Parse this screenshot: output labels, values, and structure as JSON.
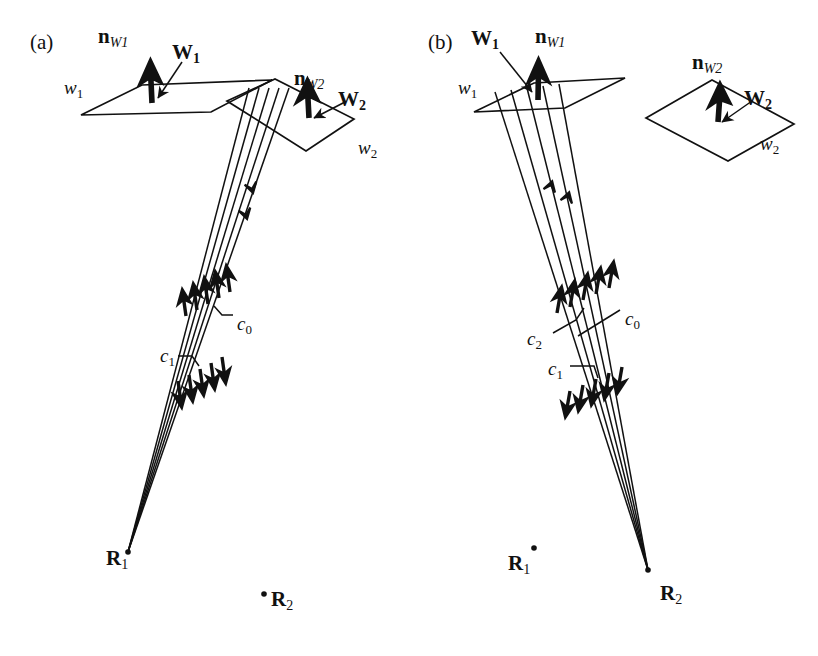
{
  "figure": {
    "background": "#ffffff",
    "ink": "#111111",
    "width": 818,
    "height": 656
  },
  "panels": [
    {
      "id": "a",
      "tag": "(a)",
      "tag_pos": [
        30,
        32
      ],
      "labels": {
        "plane1": "w",
        "plane1_sub": "1",
        "plane1_pos": [
          64,
          78
        ],
        "plane2": "w",
        "plane2_sub": "2",
        "plane2_pos": [
          358,
          138
        ],
        "normal1": "n",
        "normal1_sub": "W1",
        "normal1_pos": [
          98,
          26
        ],
        "normal2": "n",
        "normal2_sub": "W2",
        "normal2_pos": [
          294,
          68
        ],
        "vec1": "W",
        "vec1_sub": "1",
        "vec1_pos": [
          172,
          42
        ],
        "vec2": "W",
        "vec2_sub": "2",
        "vec2_pos": [
          338,
          89
        ],
        "c0": "c",
        "c0_sub": "0",
        "c0_pos": [
          237,
          314
        ],
        "c1": "c",
        "c1_sub": "1",
        "c1_pos": [
          160,
          346
        ],
        "r1": "R",
        "r1_sub": "1",
        "r1_pos": [
          106,
          548
        ],
        "r2": "R",
        "r2_sub": "2",
        "r2_pos": [
          271,
          589
        ]
      },
      "apex": [
        128,
        552
      ],
      "ray_count": 5,
      "ray_direction": "downward",
      "second_point_marker": [
        264,
        594
      ]
    },
    {
      "id": "b",
      "tag": "(b)",
      "tag_pos": [
        428,
        32
      ],
      "labels": {
        "plane1": "w",
        "plane1_sub": "1",
        "plane1_pos": [
          458,
          78
        ],
        "plane2": "w",
        "plane2_sub": "2",
        "plane2_pos": [
          760,
          134
        ],
        "normal1": "n",
        "normal1_sub": "W1",
        "normal1_pos": [
          535,
          26
        ],
        "normal2": "n",
        "normal2_sub": "W2",
        "normal2_pos": [
          692,
          52
        ],
        "vec1": "W",
        "vec1_sub": "1",
        "vec1_pos": [
          471,
          28
        ],
        "vec2": "W",
        "vec2_sub": "2",
        "vec2_pos": [
          744,
          88
        ],
        "c0": "c",
        "c0_sub": "0",
        "c0_pos": [
          625,
          309
        ],
        "c1": "c",
        "c1_sub": "1",
        "c1_pos": [
          548,
          359
        ],
        "c2": "c",
        "c2_sub": "2",
        "c2_pos": [
          527,
          329
        ],
        "r1": "R",
        "r1_sub": "1",
        "r1_pos": [
          508,
          553
        ],
        "r2": "R",
        "r2_sub": "2",
        "r2_pos": [
          660,
          583
        ]
      },
      "apex": [
        648,
        570
      ],
      "ray_count": 5,
      "ray_direction": "upward",
      "second_point_marker": [
        534,
        548
      ]
    }
  ],
  "geometry_note": {
    "description": "Two-panel line diagram of light rays from point sources R1 and R2 passing through wavefront planes w1 and w2 with surface normals nW1, nW2 and wave vectors W1, W2; ray bundles labelled c0, c1, c2."
  }
}
